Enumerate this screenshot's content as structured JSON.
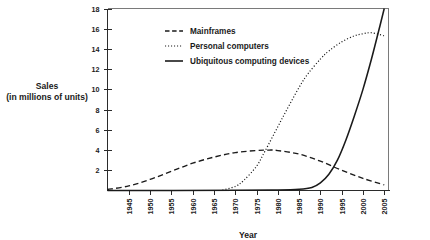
{
  "chart_data": {
    "type": "line",
    "title": "",
    "xlabel": "Year",
    "ylabel": "Sales\n(in millions of units)",
    "ylabel_line1": "Sales",
    "ylabel_line2": "(in millions of units)",
    "grid": false,
    "legend_position": "top-center",
    "xlim": [
      1940,
      2006
    ],
    "ylim": [
      0,
      18
    ],
    "x_ticks": [
      1945,
      1950,
      1955,
      1960,
      1965,
      1970,
      1975,
      1980,
      1985,
      1990,
      1995,
      2000,
      2005
    ],
    "x_tick_labels": [
      "1945",
      "1950",
      "1955",
      "1960",
      "1965",
      "1970",
      "1975",
      "1980",
      "1985",
      "1990",
      "1995",
      "2000",
      "2005"
    ],
    "x_tick_rotation": 90,
    "y_ticks": [
      2,
      4,
      6,
      8,
      10,
      12,
      14,
      16,
      18
    ],
    "y_tick_labels": [
      "2",
      "4",
      "6",
      "8",
      "10",
      "12",
      "14",
      "16",
      "18"
    ],
    "series": [
      {
        "name": "Mainframes",
        "style": "dashed",
        "color": "#1a1a1a",
        "x": [
          1940,
          1945,
          1950,
          1955,
          1960,
          1965,
          1970,
          1975,
          1978,
          1980,
          1985,
          1990,
          1995,
          2000,
          2005
        ],
        "values": [
          0.1,
          0.45,
          1.1,
          1.9,
          2.7,
          3.3,
          3.75,
          3.95,
          4.0,
          3.95,
          3.6,
          2.9,
          2.0,
          1.2,
          0.55
        ]
      },
      {
        "name": "Personal computers",
        "style": "dotted",
        "color": "#1a1a1a",
        "x": [
          1967,
          1970,
          1972,
          1975,
          1977,
          1980,
          1982,
          1985,
          1987,
          1990,
          1992,
          1995,
          1998,
          2000,
          2002,
          2005
        ],
        "values": [
          0.05,
          0.4,
          1.0,
          2.4,
          3.9,
          6.3,
          7.9,
          10.2,
          11.5,
          13.0,
          13.8,
          14.7,
          15.3,
          15.5,
          15.6,
          15.3
        ]
      },
      {
        "name": "Ubiquitous computing devices",
        "style": "solid",
        "color": "#1a1a1a",
        "x": [
          1940,
          1970,
          1980,
          1985,
          1988,
          1990,
          1992,
          1994,
          1996,
          1998,
          2000,
          2002,
          2004,
          2005
        ],
        "values": [
          0.0,
          0.02,
          0.05,
          0.12,
          0.3,
          0.75,
          1.6,
          3.0,
          5.0,
          7.4,
          10.0,
          13.0,
          16.3,
          18.0
        ]
      }
    ],
    "legend": [
      {
        "label": "Mainframes",
        "style": "dashed"
      },
      {
        "label": "Personal computers",
        "style": "dotted"
      },
      {
        "label": "Ubiquitous computing devices",
        "style": "solid"
      }
    ]
  }
}
